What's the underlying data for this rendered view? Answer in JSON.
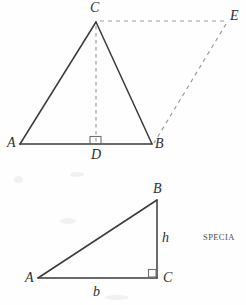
{
  "page": {
    "width": 246,
    "height": 305,
    "background": "#fefefe",
    "stroke_solid": "#3a3a3a",
    "stroke_dashed": "#9a9a9a"
  },
  "figures": [
    {
      "id": "isosceles-triangle-with-parallelogram",
      "labels": {
        "apex": "C",
        "left_base": "A",
        "right_base": "B",
        "foot_of_altitude": "D",
        "translated_apex": "E"
      },
      "points": {
        "A": [
          20,
          144
        ],
        "B": [
          152,
          144
        ],
        "C": [
          96,
          22
        ],
        "D": [
          96,
          144
        ],
        "E": [
          227,
          21
        ]
      },
      "solid_segments": [
        [
          "A",
          "C"
        ],
        [
          "C",
          "B"
        ],
        [
          "A",
          "B"
        ]
      ],
      "dashed_segments": [
        [
          "C",
          "D"
        ],
        [
          "C",
          "E"
        ],
        [
          "E",
          "B"
        ]
      ],
      "right_angle_at": "D"
    },
    {
      "id": "right-triangle-base-height",
      "labels": {
        "top": "B",
        "left": "A",
        "right_angle_vertex": "C",
        "base_side": "b",
        "height_side": "h"
      },
      "points": {
        "A": [
          38,
          278
        ],
        "B": [
          157,
          200
        ],
        "C": [
          157,
          278
        ]
      },
      "solid_segments": [
        [
          "A",
          "B"
        ],
        [
          "B",
          "C"
        ],
        [
          "A",
          "C"
        ]
      ],
      "right_angle_at": "C"
    }
  ],
  "annotations": {
    "side_text": "SPECIA"
  }
}
